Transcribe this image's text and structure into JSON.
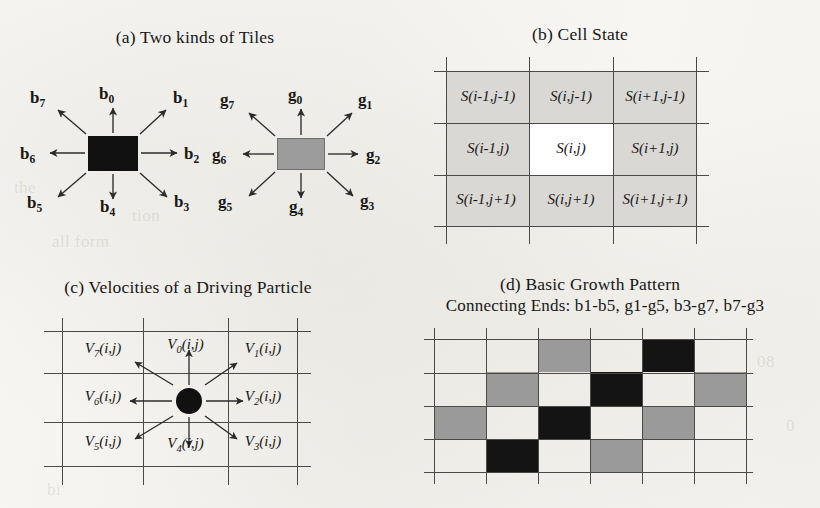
{
  "figure": {
    "panels": [
      {
        "id": "a",
        "title": "(a) Two kinds of Tiles"
      },
      {
        "id": "b",
        "title": "(b) Cell  State"
      },
      {
        "id": "c",
        "title": "(c) Velocities of a Driving Particle"
      },
      {
        "id": "d",
        "title": "(d) Basic Growth Pattern",
        "subtitle": "Connecting Ends: b1-b5, g1-g5, b3-g7, b7-g3"
      }
    ]
  },
  "panel_a": {
    "black_tile": {
      "color": "#111111",
      "labels": [
        {
          "base": "b",
          "sub": "0"
        },
        {
          "base": "b",
          "sub": "1"
        },
        {
          "base": "b",
          "sub": "2"
        },
        {
          "base": "b",
          "sub": "3"
        },
        {
          "base": "b",
          "sub": "4"
        },
        {
          "base": "b",
          "sub": "5"
        },
        {
          "base": "b",
          "sub": "6"
        },
        {
          "base": "b",
          "sub": "7"
        }
      ]
    },
    "gray_tile": {
      "color": "#9c9c9c",
      "labels": [
        {
          "base": "g",
          "sub": "0"
        },
        {
          "base": "g",
          "sub": "1"
        },
        {
          "base": "g",
          "sub": "2"
        },
        {
          "base": "g",
          "sub": "3"
        },
        {
          "base": "g",
          "sub": "4"
        },
        {
          "base": "g",
          "sub": "5"
        },
        {
          "base": "g",
          "sub": "6"
        },
        {
          "base": "g",
          "sub": "7"
        }
      ]
    }
  },
  "panel_b": {
    "fill_color": "#d9d8d4",
    "center_fill": "#ffffff",
    "rows": [
      [
        "S(i-1,j-1)",
        "S(i,j-1)",
        "S(i+1,j-1)"
      ],
      [
        "S(i-1,j)",
        "S(i,j)",
        "S(i+1,j)"
      ],
      [
        "S(i-1,j+1)",
        "S(i,j+1)",
        "S(i+1,j+1)"
      ]
    ]
  },
  "panel_c": {
    "particle_color": "#111111",
    "cells": [
      {
        "base": "V",
        "sub": "7",
        "arg": "(i,j)"
      },
      {
        "base": "V",
        "sub": "0",
        "arg": "(i,j)"
      },
      {
        "base": "V",
        "sub": "1",
        "arg": "(i,j)"
      },
      {
        "base": "V",
        "sub": "6",
        "arg": "(i,j)"
      },
      {
        "base": "V",
        "sub": "2",
        "arg": "(i,j)"
      },
      {
        "base": "V",
        "sub": "5",
        "arg": "(i,j)"
      },
      {
        "base": "V",
        "sub": "4",
        "arg": "(i,j)"
      },
      {
        "base": "V",
        "sub": "3",
        "arg": "(i,j)"
      }
    ]
  },
  "panel_d": {
    "black": "#141414",
    "gray": "#9a9a9a",
    "white": "#ffffff",
    "grid": [
      [
        "white",
        "white",
        "gray",
        "white",
        "black",
        "white"
      ],
      [
        "white",
        "gray",
        "white",
        "black",
        "white",
        "gray"
      ],
      [
        "gray",
        "white",
        "black",
        "white",
        "gray",
        "white"
      ],
      [
        "white",
        "black",
        "white",
        "gray",
        "white",
        "white"
      ]
    ]
  },
  "ghost_text": {
    "g1": "the",
    "g2": "tion",
    "g3": "all form",
    "g4": "08",
    "g5": "0",
    "g6": "bi"
  }
}
